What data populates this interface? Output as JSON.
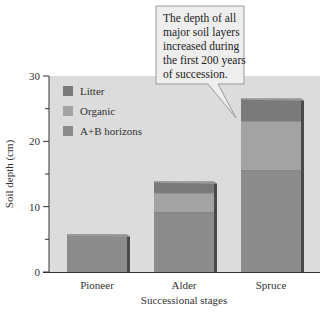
{
  "chart_data": {
    "type": "bar",
    "stacked": true,
    "title": "",
    "xlabel": "Successional stages",
    "ylabel": "Soil depth (cm)",
    "ylim": [
      0,
      30
    ],
    "yticks": [
      0,
      10,
      20,
      30
    ],
    "yminor_ticks": [
      5,
      15,
      25
    ],
    "categories": [
      "Pioneer",
      "Alder",
      "Spruce"
    ],
    "series": [
      {
        "name": "A+B horizons",
        "color": "#8c8c8c",
        "values": [
          5.7,
          9.2,
          15.6
        ]
      },
      {
        "name": "Organic",
        "color": "#a3a3a3",
        "values": [
          0,
          2.9,
          7.5
        ]
      },
      {
        "name": "Litter",
        "color": "#7a7a7a",
        "values": [
          0,
          1.7,
          3.4
        ]
      }
    ],
    "legend": {
      "position": "top-left",
      "entries": [
        "Litter",
        "Organic",
        "A+B horizons"
      ]
    },
    "annotation": {
      "text_lines": [
        "The depth of all",
        "major soil layers",
        "increased during",
        "the first 200 years",
        "of succession."
      ],
      "points_to": "Spruce"
    },
    "plot_background": "#dcdcdc",
    "grid": false
  }
}
